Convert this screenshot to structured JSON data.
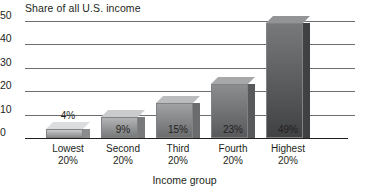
{
  "chart_data": {
    "type": "bar",
    "title": "",
    "ylabel": "Share of all U.S. income",
    "xlabel": "Income group",
    "categories": [
      "Lowest 20%",
      "Second 20%",
      "Third 20%",
      "Fourth 20%",
      "Highest 20%"
    ],
    "category_lines": [
      [
        "Lowest",
        "20%"
      ],
      [
        "Second",
        "20%"
      ],
      [
        "Third",
        "20%"
      ],
      [
        "Fourth",
        "20%"
      ],
      [
        "Highest",
        "20%"
      ]
    ],
    "values": [
      4,
      9,
      15,
      23,
      49
    ],
    "data_labels": [
      "4%",
      "9%",
      "15%",
      "23%",
      "49%"
    ],
    "ylim": [
      0,
      50
    ],
    "yticks": [
      50,
      40,
      30,
      20,
      10,
      0
    ],
    "ytick_labels": [
      "50",
      "40",
      "30",
      "20",
      "10",
      "0"
    ],
    "grid": true,
    "legend": "none",
    "bar_colors": [
      "#c9cacc",
      "#b3b4b6",
      "#a0a2a4",
      "#8b8d8f",
      "#77797b"
    ],
    "bar_side_colors": [
      "#8a8c8e",
      "#77797b",
      "#6a6c6e",
      "#57595b",
      "#3f4143"
    ],
    "bar_top_colors": [
      "#dcdddf",
      "#cacbcd",
      "#babcbe",
      "#a6a8aa",
      "#929496"
    ],
    "axis_color": "#231f20",
    "gridline_color": "#6d6e71"
  },
  "axes": {
    "y_title": "Share of all U.S. income",
    "x_title": "Income group"
  }
}
